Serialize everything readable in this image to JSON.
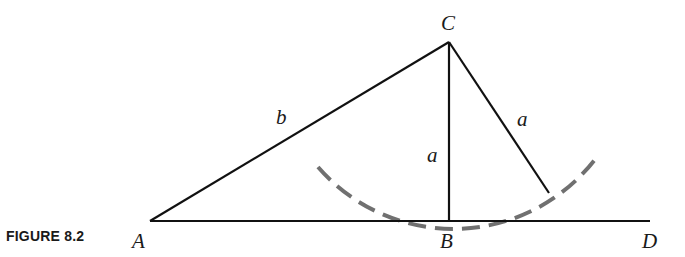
{
  "figure": {
    "caption": "FIGURE 8.2",
    "vertices": {
      "A": {
        "label": "A",
        "x": 150,
        "y": 221
      },
      "B": {
        "label": "B",
        "x": 449,
        "y": 221
      },
      "C": {
        "label": "C",
        "x": 449,
        "y": 42
      },
      "D": {
        "label": "D",
        "x": 650,
        "y": 221
      },
      "E": {
        "x": 549,
        "y": 193
      }
    },
    "side_labels": {
      "AC": "b",
      "CB": "a",
      "CE": "a"
    },
    "arc": {
      "center": "C",
      "radius": 179,
      "style": "dashed",
      "color": "#707070"
    },
    "line_color": "#111111"
  }
}
